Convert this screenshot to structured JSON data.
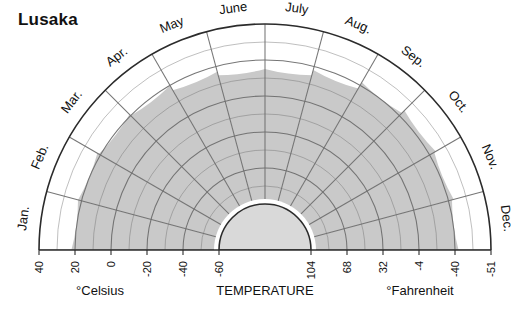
{
  "title": "Lusaka",
  "axis": {
    "temperature_label": "TEMPERATURE",
    "celsius_label": "°Celsius",
    "fahrenheit_label": "°Fahrenheit",
    "celsius_ticks": [
      "40",
      "20",
      "0",
      "-20",
      "-40",
      "-60"
    ],
    "fahrenheit_ticks": [
      "-51",
      "-40",
      "-4",
      "32",
      "68",
      "104"
    ]
  },
  "months": [
    "Jan.",
    "Feb.",
    "Mar.",
    "Apr.",
    "May",
    "June",
    "July",
    "Aug.",
    "Sep.",
    "Oct.",
    "Nov.",
    "Dec."
  ],
  "colors": {
    "band_fill": "#c9c9c9",
    "inner_fill": "#d9d9d9",
    "outer_fill": "#ffffff",
    "grid": "#6f6f6f",
    "outline": "#2b2b2b",
    "text": "#111111"
  },
  "chart_data": {
    "type": "area",
    "subtype": "semicircular-polar-climate-diagram",
    "title": "Lusaka",
    "xlabel": "",
    "ylabel": "TEMPERATURE",
    "grid": true,
    "legend": "none",
    "categories": [
      "Jan.",
      "Feb.",
      "Mar.",
      "Apr.",
      "May",
      "June",
      "July",
      "Aug.",
      "Sep.",
      "Oct.",
      "Nov.",
      "Dec."
    ],
    "radial_axis": {
      "unit_primary": "°Celsius",
      "unit_secondary": "°Fahrenheit",
      "ticks_celsius": [
        40,
        20,
        0,
        -20,
        -40,
        -60
      ],
      "ticks_fahrenheit": [
        -51,
        -40,
        -4,
        32,
        68,
        104
      ],
      "range_celsius": [
        -60,
        40
      ],
      "direction": "outward-increasing"
    },
    "series": [
      {
        "name": "Monthly temperature (°C)",
        "values": [
          22,
          22,
          21,
          20,
          17,
          15,
          15,
          18,
          22,
          24,
          23,
          22
        ]
      }
    ],
    "annotations": []
  }
}
